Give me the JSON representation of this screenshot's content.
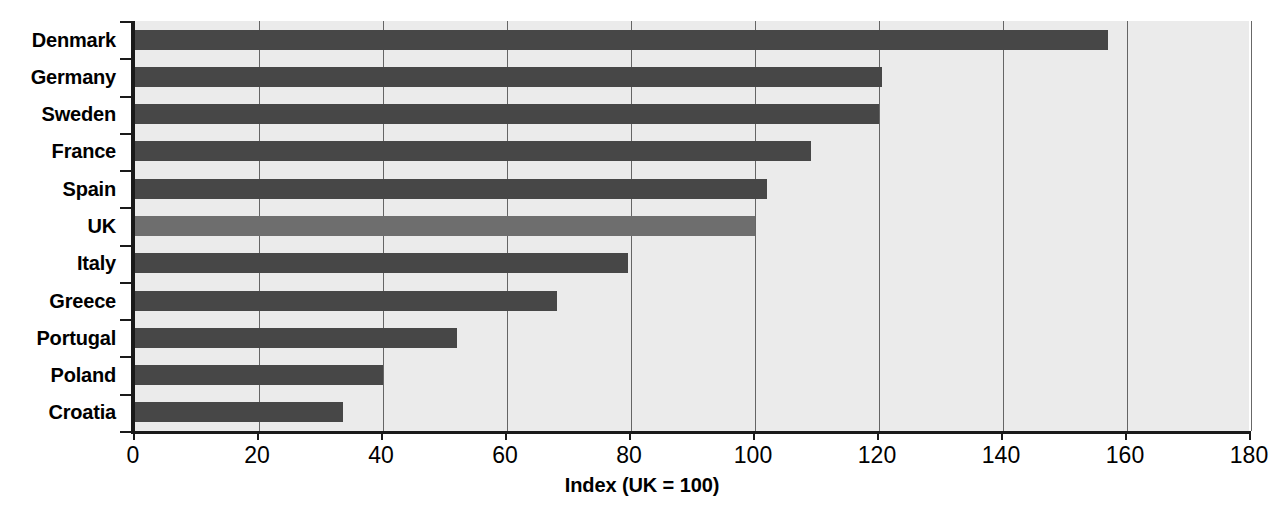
{
  "chart_data": {
    "type": "bar",
    "orientation": "horizontal",
    "title": "",
    "subtitle": "",
    "xlabel": "Index (UK = 100)",
    "ylabel": "",
    "xlim": [
      0,
      180
    ],
    "ylim": null,
    "xticks": [
      0,
      20,
      40,
      60,
      80,
      100,
      120,
      140,
      160,
      180
    ],
    "xtick_labels": [
      "0",
      "20",
      "40",
      "60",
      "80",
      "100",
      "120",
      "140",
      "160",
      "180"
    ],
    "grid": "vertical",
    "legend": null,
    "categories": [
      "Denmark",
      "Germany",
      "Sweden",
      "France",
      "Spain",
      "UK",
      "Italy",
      "Greece",
      "Portugal",
      "Poland",
      "Croatia"
    ],
    "values": [
      157,
      120.5,
      120,
      109,
      102,
      100,
      79.5,
      68,
      52,
      40,
      33.5
    ],
    "bars": [
      {
        "label": "Denmark",
        "value": 157,
        "highlight": false
      },
      {
        "label": "Germany",
        "value": 120.5,
        "highlight": false
      },
      {
        "label": "Sweden",
        "value": 120,
        "highlight": false
      },
      {
        "label": "France",
        "value": 109,
        "highlight": false
      },
      {
        "label": "Spain",
        "value": 102,
        "highlight": false
      },
      {
        "label": "UK",
        "value": 100,
        "highlight": true
      },
      {
        "label": "Italy",
        "value": 79.5,
        "highlight": false
      },
      {
        "label": "Greece",
        "value": 68,
        "highlight": false
      },
      {
        "label": "Portugal",
        "value": 52,
        "highlight": false
      },
      {
        "label": "Poland",
        "value": 40,
        "highlight": false
      },
      {
        "label": "Croatia",
        "value": 33.5,
        "highlight": false
      }
    ],
    "colors": {
      "bar": "#474747",
      "bar_highlight": "#6e6e6e",
      "plot_background": "#ebebeb",
      "gridline": "#4d4d4d",
      "axis": "#1a1a1a",
      "text": "#000000",
      "page_background": "#ffffff"
    }
  }
}
